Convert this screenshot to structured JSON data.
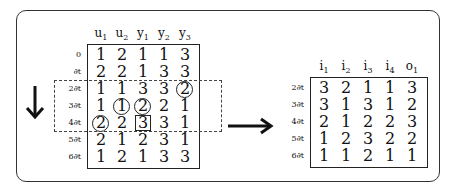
{
  "left_table": {
    "headers": [
      "u",
      "u",
      "y",
      "y",
      "y"
    ],
    "header_subs": [
      "1",
      "2",
      "1",
      "2",
      "3"
    ],
    "row_labels": [
      "0",
      "∂t",
      "2∂t",
      "3∂t",
      "4∂t",
      "5∂t",
      "6∂t"
    ],
    "rows": [
      [
        "1",
        "2",
        "1",
        "1",
        "3"
      ],
      [
        "2",
        "2",
        "1",
        "3",
        "3"
      ],
      [
        "1",
        "1",
        "3",
        "3",
        "2"
      ],
      [
        "1",
        "1",
        "2",
        "2",
        "1"
      ],
      [
        "2",
        "2",
        "3",
        "3",
        "1"
      ],
      [
        "2",
        "1",
        "2",
        "3",
        "1"
      ],
      [
        "1",
        "2",
        "1",
        "3",
        "3"
      ]
    ],
    "circled": [
      [
        2,
        4
      ],
      [
        3,
        1
      ],
      [
        3,
        2
      ],
      [
        4,
        0
      ]
    ],
    "boxed": [
      [
        4,
        2
      ]
    ],
    "window_rows": [
      2,
      4
    ]
  },
  "right_table": {
    "headers": [
      "i",
      "i",
      "i",
      "i",
      "o"
    ],
    "header_subs": [
      "1",
      "2",
      "3",
      "4",
      "1"
    ],
    "row_labels": [
      "2∂t",
      "3∂t",
      "4∂t",
      "5∂t",
      "6∂t"
    ],
    "rows": [
      [
        "3",
        "2",
        "1",
        "1",
        "3"
      ],
      [
        "3",
        "1",
        "3",
        "1",
        "2"
      ],
      [
        "2",
        "1",
        "2",
        "2",
        "3"
      ],
      [
        "1",
        "2",
        "3",
        "2",
        "2"
      ],
      [
        "1",
        "1",
        "2",
        "1",
        "1"
      ]
    ]
  },
  "icons": {
    "down": "arrow-down-icon",
    "right": "arrow-right-icon"
  }
}
